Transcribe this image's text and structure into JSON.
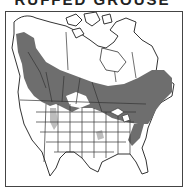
{
  "title": "RUFFED GROUSE",
  "map": {
    "region": "North America",
    "legend": [
      {
        "label": "Range",
        "color": "#6e6e6e"
      }
    ],
    "colors": {
      "range_fill": "#6e6e6e",
      "land_fill": "#ffffff",
      "border_line": "#333333",
      "light_patch": "#bdbdbd"
    }
  }
}
